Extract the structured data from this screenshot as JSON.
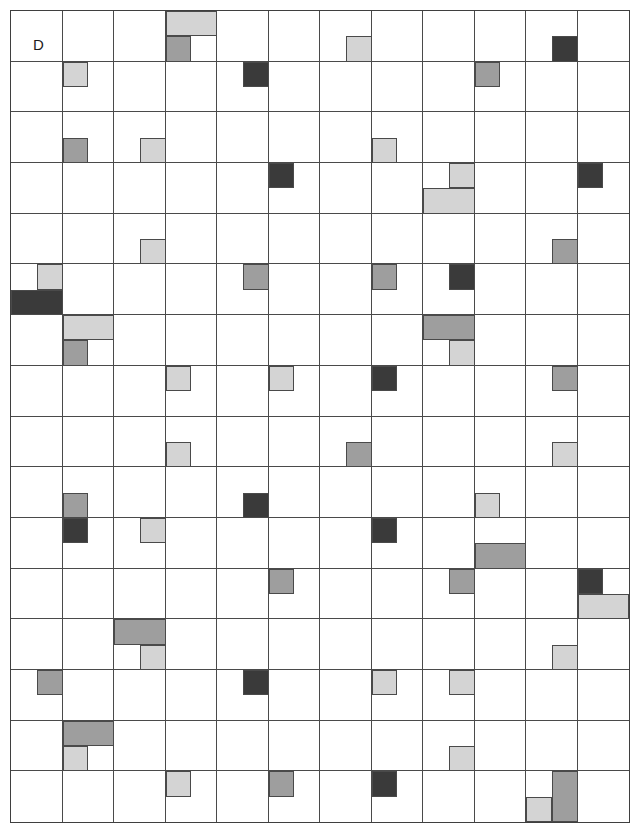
{
  "figure": {
    "panel_label": "D",
    "grid": {
      "columns": 12,
      "rows": 16
    },
    "palette": {
      "background": "#ffffff",
      "grid_line": "#4a4a4a",
      "frame": "#3f3f3f",
      "light": "#d4d4d4",
      "medium": "#9e9e9e",
      "dark": "#3a3a3a",
      "white": "#ffffff"
    },
    "legend": {
      "light_label": "light-gray-block",
      "medium_label": "medium-gray-block",
      "dark_label": "dark-gray-block"
    }
  },
  "chart_data": {
    "type": "heatmap",
    "title": "D",
    "xlabel": "",
    "ylabel": "",
    "grid": true,
    "columns": 12,
    "rows": 16,
    "cell_width": 51.6,
    "cell_height": 50.8,
    "origin_x": 10,
    "origin_y": 10,
    "shade_values": {
      "light": 1,
      "medium": 2,
      "dark": 3
    },
    "blocks": [
      {
        "col": 3,
        "row": 0,
        "x": 0.0,
        "y": 0.0,
        "w": 1.0,
        "h": 0.5,
        "shade": "light"
      },
      {
        "col": 3,
        "row": 0,
        "x": 0.0,
        "y": 0.5,
        "w": 0.5,
        "h": 0.5,
        "shade": "medium"
      },
      {
        "col": 6,
        "row": 0,
        "x": 0.5,
        "y": 0.5,
        "w": 0.5,
        "h": 0.5,
        "shade": "light"
      },
      {
        "col": 10,
        "row": 0,
        "x": 0.5,
        "y": 0.5,
        "w": 0.5,
        "h": 0.5,
        "shade": "dark"
      },
      {
        "col": 1,
        "row": 1,
        "x": 0.0,
        "y": 0.0,
        "w": 0.5,
        "h": 0.5,
        "shade": "light"
      },
      {
        "col": 4,
        "row": 1,
        "x": 0.5,
        "y": 0.0,
        "w": 0.5,
        "h": 0.5,
        "shade": "dark"
      },
      {
        "col": 9,
        "row": 1,
        "x": 0.0,
        "y": 0.0,
        "w": 0.5,
        "h": 0.5,
        "shade": "medium"
      },
      {
        "col": 1,
        "row": 2,
        "x": 0.0,
        "y": 0.5,
        "w": 0.5,
        "h": 0.5,
        "shade": "medium"
      },
      {
        "col": 2,
        "row": 2,
        "x": 0.5,
        "y": 0.5,
        "w": 0.5,
        "h": 0.5,
        "shade": "light"
      },
      {
        "col": 7,
        "row": 2,
        "x": 0.0,
        "y": 0.5,
        "w": 0.5,
        "h": 0.5,
        "shade": "light"
      },
      {
        "col": 5,
        "row": 3,
        "x": 0.0,
        "y": 0.0,
        "w": 0.5,
        "h": 0.5,
        "shade": "dark"
      },
      {
        "col": 8,
        "row": 3,
        "x": 0.5,
        "y": 0.0,
        "w": 0.5,
        "h": 0.5,
        "shade": "light"
      },
      {
        "col": 8,
        "row": 3,
        "x": 0.0,
        "y": 0.5,
        "w": 1.0,
        "h": 0.5,
        "shade": "light"
      },
      {
        "col": 11,
        "row": 3,
        "x": 0.0,
        "y": 0.0,
        "w": 0.5,
        "h": 0.5,
        "shade": "dark"
      },
      {
        "col": 2,
        "row": 4,
        "x": 0.5,
        "y": 0.5,
        "w": 0.5,
        "h": 0.5,
        "shade": "light"
      },
      {
        "col": 10,
        "row": 4,
        "x": 0.5,
        "y": 0.5,
        "w": 0.5,
        "h": 0.5,
        "shade": "medium"
      },
      {
        "col": 0,
        "row": 5,
        "x": 0.5,
        "y": 0.0,
        "w": 0.5,
        "h": 0.5,
        "shade": "light"
      },
      {
        "col": 0,
        "row": 5,
        "x": 0.0,
        "y": 0.5,
        "w": 1.0,
        "h": 0.5,
        "shade": "dark"
      },
      {
        "col": 4,
        "row": 5,
        "x": 0.5,
        "y": 0.0,
        "w": 0.5,
        "h": 0.5,
        "shade": "medium"
      },
      {
        "col": 7,
        "row": 5,
        "x": 0.0,
        "y": 0.0,
        "w": 0.5,
        "h": 0.5,
        "shade": "medium"
      },
      {
        "col": 8,
        "row": 5,
        "x": 0.5,
        "y": 0.0,
        "w": 0.5,
        "h": 0.5,
        "shade": "dark"
      },
      {
        "col": 1,
        "row": 6,
        "x": 0.0,
        "y": 0.0,
        "w": 1.0,
        "h": 0.5,
        "shade": "light"
      },
      {
        "col": 1,
        "row": 6,
        "x": 0.0,
        "y": 0.5,
        "w": 0.5,
        "h": 0.5,
        "shade": "medium"
      },
      {
        "col": 8,
        "row": 6,
        "x": 0.0,
        "y": 0.0,
        "w": 1.0,
        "h": 0.5,
        "shade": "medium"
      },
      {
        "col": 8,
        "row": 6,
        "x": 0.5,
        "y": 0.5,
        "w": 0.5,
        "h": 0.5,
        "shade": "light"
      },
      {
        "col": 3,
        "row": 7,
        "x": 0.0,
        "y": 0.0,
        "w": 0.5,
        "h": 0.5,
        "shade": "light"
      },
      {
        "col": 5,
        "row": 7,
        "x": 0.0,
        "y": 0.0,
        "w": 0.5,
        "h": 0.5,
        "shade": "light"
      },
      {
        "col": 7,
        "row": 7,
        "x": 0.0,
        "y": 0.0,
        "w": 0.5,
        "h": 0.5,
        "shade": "dark"
      },
      {
        "col": 10,
        "row": 7,
        "x": 0.5,
        "y": 0.0,
        "w": 0.5,
        "h": 0.5,
        "shade": "medium"
      },
      {
        "col": 3,
        "row": 8,
        "x": 0.0,
        "y": 0.5,
        "w": 0.5,
        "h": 0.5,
        "shade": "light"
      },
      {
        "col": 6,
        "row": 8,
        "x": 0.5,
        "y": 0.5,
        "w": 0.5,
        "h": 0.5,
        "shade": "medium"
      },
      {
        "col": 10,
        "row": 8,
        "x": 0.5,
        "y": 0.5,
        "w": 0.5,
        "h": 0.5,
        "shade": "light"
      },
      {
        "col": 1,
        "row": 9,
        "x": 0.0,
        "y": 0.5,
        "w": 0.5,
        "h": 0.5,
        "shade": "medium"
      },
      {
        "col": 4,
        "row": 9,
        "x": 0.5,
        "y": 0.5,
        "w": 0.5,
        "h": 0.5,
        "shade": "dark"
      },
      {
        "col": 9,
        "row": 9,
        "x": 0.0,
        "y": 0.5,
        "w": 0.5,
        "h": 0.5,
        "shade": "light"
      },
      {
        "col": 9,
        "row": 9,
        "x": 0.0,
        "y": 1.0,
        "w": 1.0,
        "h": 0.0,
        "shade": "light"
      },
      {
        "col": 1,
        "row": 10,
        "x": 0.0,
        "y": 0.0,
        "w": 0.5,
        "h": 0.5,
        "shade": "dark"
      },
      {
        "col": 2,
        "row": 10,
        "x": 0.5,
        "y": 0.0,
        "w": 0.5,
        "h": 0.5,
        "shade": "light"
      },
      {
        "col": 7,
        "row": 10,
        "x": 0.0,
        "y": 0.0,
        "w": 0.5,
        "h": 0.5,
        "shade": "dark"
      },
      {
        "col": 9,
        "row": 10,
        "x": 0.0,
        "y": 0.5,
        "w": 1.0,
        "h": 0.5,
        "shade": "medium"
      },
      {
        "col": 5,
        "row": 11,
        "x": 0.0,
        "y": 0.0,
        "w": 0.5,
        "h": 0.5,
        "shade": "medium"
      },
      {
        "col": 8,
        "row": 11,
        "x": 0.5,
        "y": 0.0,
        "w": 0.5,
        "h": 0.5,
        "shade": "medium"
      },
      {
        "col": 11,
        "row": 11,
        "x": 0.0,
        "y": 0.0,
        "w": 0.5,
        "h": 0.5,
        "shade": "dark"
      },
      {
        "col": 11,
        "row": 11,
        "x": 0.0,
        "y": 0.5,
        "w": 1.0,
        "h": 0.5,
        "shade": "light"
      },
      {
        "col": 2,
        "row": 12,
        "x": 0.0,
        "y": 0.0,
        "w": 1.0,
        "h": 0.5,
        "shade": "medium"
      },
      {
        "col": 2,
        "row": 12,
        "x": 0.5,
        "y": 0.5,
        "w": 0.5,
        "h": 0.5,
        "shade": "light"
      },
      {
        "col": 10,
        "row": 12,
        "x": 0.5,
        "y": 0.5,
        "w": 0.5,
        "h": 0.5,
        "shade": "light"
      },
      {
        "col": 0,
        "row": 13,
        "x": 0.5,
        "y": 0.0,
        "w": 0.5,
        "h": 0.5,
        "shade": "medium"
      },
      {
        "col": 4,
        "row": 13,
        "x": 0.5,
        "y": 0.0,
        "w": 0.5,
        "h": 0.5,
        "shade": "dark"
      },
      {
        "col": 7,
        "row": 13,
        "x": 0.0,
        "y": 0.0,
        "w": 0.5,
        "h": 0.5,
        "shade": "light"
      },
      {
        "col": 8,
        "row": 13,
        "x": 0.5,
        "y": 0.0,
        "w": 0.5,
        "h": 0.5,
        "shade": "light"
      },
      {
        "col": 1,
        "row": 14,
        "x": 0.0,
        "y": 0.0,
        "w": 1.0,
        "h": 0.5,
        "shade": "medium"
      },
      {
        "col": 1,
        "row": 14,
        "x": 0.0,
        "y": 0.5,
        "w": 0.5,
        "h": 0.5,
        "shade": "light"
      },
      {
        "col": 8,
        "row": 14,
        "x": 0.5,
        "y": 0.5,
        "w": 0.5,
        "h": 0.5,
        "shade": "light"
      },
      {
        "col": 3,
        "row": 15,
        "x": 0.0,
        "y": 0.0,
        "w": 0.5,
        "h": 0.5,
        "shade": "light"
      },
      {
        "col": 5,
        "row": 15,
        "x": 0.0,
        "y": 0.0,
        "w": 0.5,
        "h": 0.5,
        "shade": "medium"
      },
      {
        "col": 7,
        "row": 15,
        "x": 0.0,
        "y": 0.0,
        "w": 0.5,
        "h": 0.5,
        "shade": "dark"
      },
      {
        "col": 10,
        "row": 15,
        "x": 0.0,
        "y": 0.5,
        "w": 0.5,
        "h": 0.5,
        "shade": "light"
      },
      {
        "col": 10,
        "row": 15,
        "x": 0.5,
        "y": 0.0,
        "w": 0.5,
        "h": 1.0,
        "shade": "medium"
      }
    ]
  }
}
